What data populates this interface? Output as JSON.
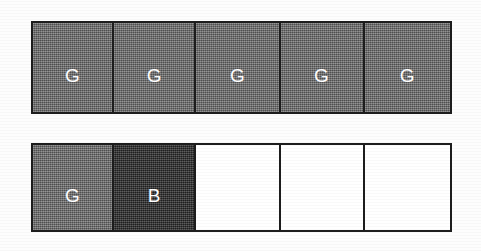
{
  "figure": {
    "background_color": "#fdfdfd",
    "border_color": "#1d1d1d",
    "label_color": "#ffffff",
    "gray_fill_color": "#6e6e6e",
    "dark_fill_color": "#2f2f2f",
    "empty_fill_color": "#ffffff",
    "rows": [
      {
        "id": "row-top",
        "name": "top-row",
        "x": 31,
        "y": 21,
        "width": 421,
        "height": 93,
        "cells": [
          {
            "label": "G",
            "fill": "gray",
            "width": 82
          },
          {
            "label": "G",
            "fill": "gray",
            "width": 83
          },
          {
            "label": "G",
            "fill": "gray",
            "width": 85
          },
          {
            "label": "G",
            "fill": "gray",
            "width": 85
          },
          {
            "label": "G",
            "fill": "gray",
            "width": 86
          }
        ]
      },
      {
        "id": "row-bottom",
        "name": "bottom-row",
        "x": 31,
        "y": 143,
        "width": 421,
        "height": 89,
        "cells": [
          {
            "label": "G",
            "fill": "gray",
            "width": 82
          },
          {
            "label": "B",
            "fill": "dark",
            "width": 83
          },
          {
            "label": "",
            "fill": "empty",
            "width": 85
          },
          {
            "label": "",
            "fill": "empty",
            "width": 85
          },
          {
            "label": "",
            "fill": "empty",
            "width": 86
          }
        ]
      }
    ]
  }
}
